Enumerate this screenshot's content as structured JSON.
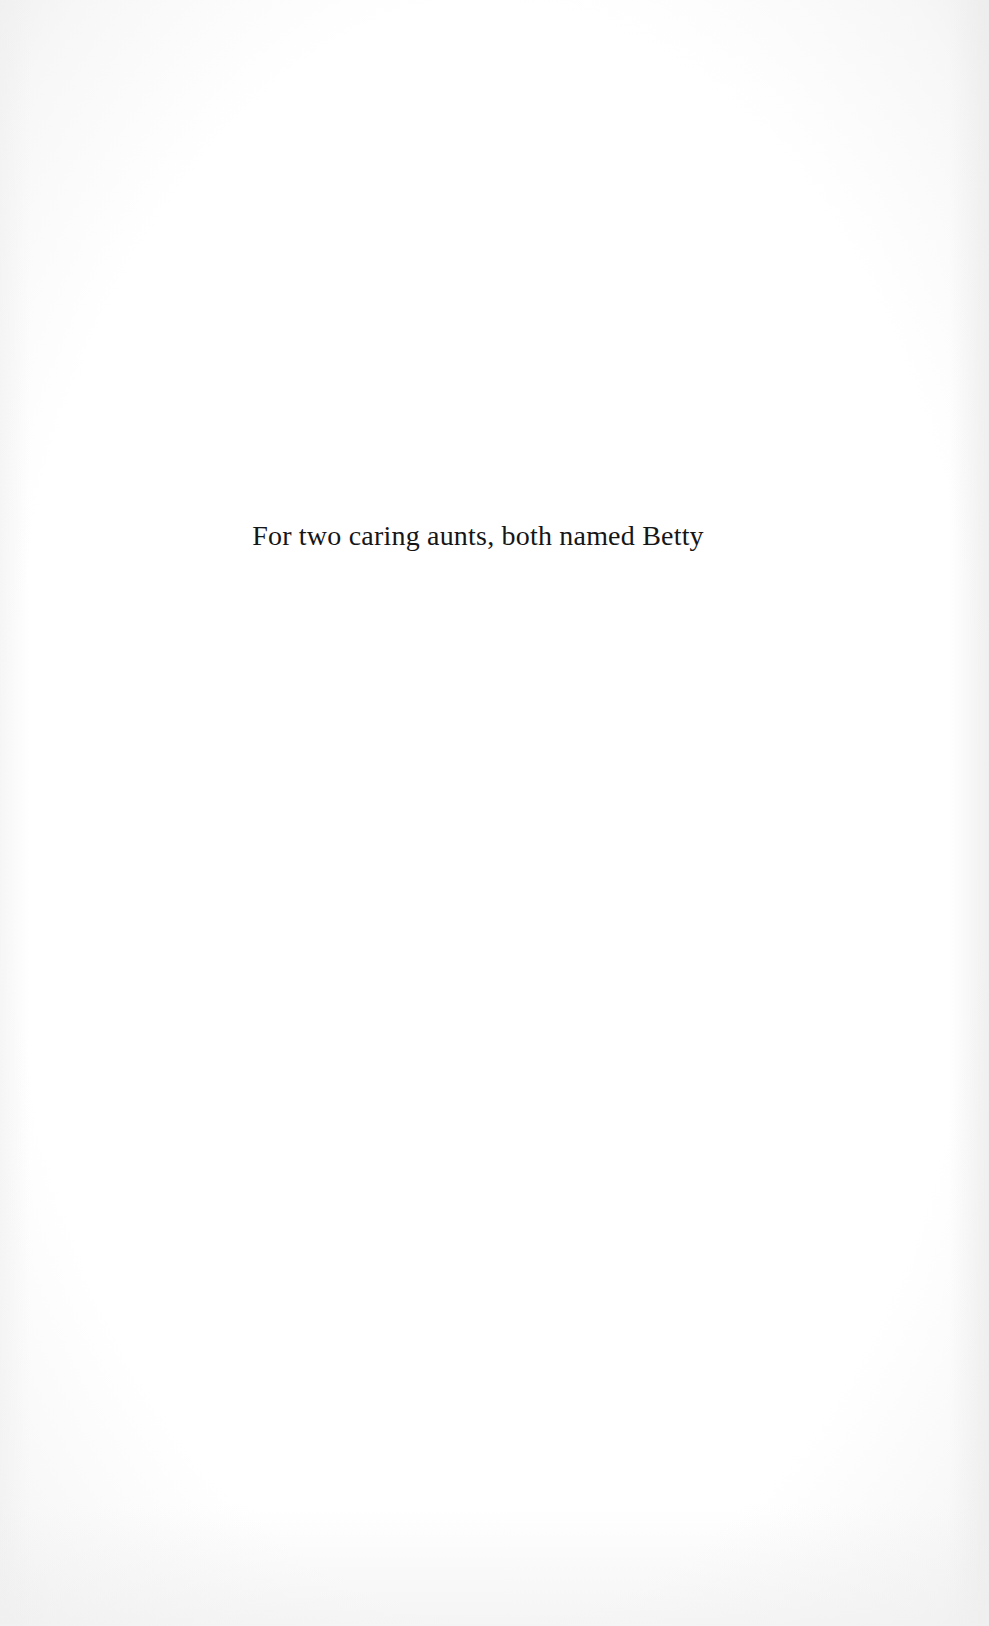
{
  "page": {
    "type": "dedication",
    "dedication_text": "For two caring aunts, both named Betty",
    "background_color": "#ffffff",
    "text_color": "#161616"
  }
}
